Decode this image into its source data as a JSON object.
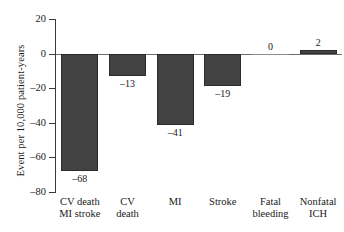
{
  "chart_data": {
    "type": "bar",
    "title": "",
    "xlabel": "",
    "ylabel": "Event per 10,000 patient-years",
    "ylim": [
      -80,
      20
    ],
    "ytick_values": [
      20,
      0,
      -20,
      -40,
      -60,
      -80
    ],
    "ytick_labels": [
      "20",
      "0",
      "–20",
      "–40",
      "–60",
      "–80"
    ],
    "grid": false,
    "legend": null,
    "bar_color": "#424242",
    "bar_edge_color": "#2c2c2c",
    "zero_line_color": "#6d6d6d",
    "categories": [
      "CV death MI stroke",
      "CV death",
      "MI",
      "Stroke",
      "Fatal bleeding",
      "Nonfatal ICH"
    ],
    "category_lines": [
      [
        "CV death",
        "MI stroke"
      ],
      [
        "CV",
        "death"
      ],
      [
        "MI",
        ""
      ],
      [
        "Stroke",
        ""
      ],
      [
        "Fatal",
        "bleeding"
      ],
      [
        "Nonfatal",
        "ICH"
      ]
    ],
    "values": [
      -68,
      -13,
      -41,
      -19,
      0,
      2
    ],
    "value_labels": [
      "–68",
      "–13",
      "–41",
      "–19",
      "0",
      "2"
    ]
  }
}
